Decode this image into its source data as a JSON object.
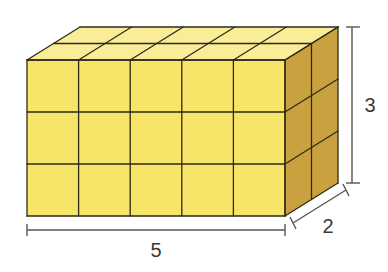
{
  "diagram": {
    "type": "rectangular-prism-of-unit-cubes",
    "dimensions": {
      "length": 5,
      "height": 3,
      "depth": 2
    },
    "labels": {
      "length": "5",
      "height": "3",
      "depth": "2"
    },
    "colors": {
      "front": "#f7e56a",
      "top": "#f9ed98",
      "side": "#c9a23f",
      "edge": "#2e2a1a",
      "dimension_line": "#555555"
    }
  }
}
